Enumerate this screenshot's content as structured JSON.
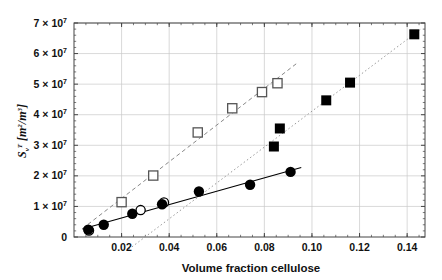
{
  "figure": {
    "title": "",
    "background": "#ffffff",
    "frame_color": "#444444",
    "grid_color": "#c9c9c9"
  },
  "axes": {
    "x": {
      "label": "Volume fraction cellulose",
      "ticks": [
        0.02,
        0.04,
        0.06,
        0.08,
        0.1,
        0.12,
        0.14
      ],
      "tick_labels": [
        "0.02",
        "0.04",
        "0.06",
        "0.08",
        "0.10",
        "0.12",
        "0.14"
      ],
      "range": [
        0.0,
        0.1475
      ]
    },
    "y": {
      "label_main": "S",
      "label_sub": "v",
      "label_sup": "T",
      "label_units": "[m2/m3]",
      "label_plain": "Sv T [m^2/m^3]",
      "ticks": [
        0,
        10000000,
        20000000,
        30000000,
        40000000,
        50000000,
        60000000,
        70000000
      ],
      "tick_labels": [
        "0",
        "1 × 10",
        "2 × 10",
        "3 × 10",
        "4 × 10",
        "5 × 10",
        "6 × 10",
        "7 × 10"
      ],
      "tick_exponent": "7",
      "range": [
        0,
        70000000
      ]
    }
  },
  "chart_data": {
    "type": "scatter",
    "title": "",
    "xlabel": "Volume fraction cellulose",
    "ylabel": "Sv T [m^2/m^3]",
    "xlim": [
      0.0,
      0.1475
    ],
    "ylim": [
      0,
      70000000
    ],
    "grid": true,
    "legend": "none",
    "series": [
      {
        "name": "filled-circles",
        "marker": "filled-circle",
        "color": "#000000",
        "fit_line": {
          "style": "solid",
          "color": "#000000",
          "x_start": 0.0035,
          "x_end": 0.0955
        },
        "points": [
          {
            "x": 0.006,
            "y": 2400000
          },
          {
            "x": 0.0125,
            "y": 4000000
          },
          {
            "x": 0.0245,
            "y": 7600000
          },
          {
            "x": 0.037,
            "y": 10700000
          },
          {
            "x": 0.0525,
            "y": 14900000
          },
          {
            "x": 0.074,
            "y": 17100000
          },
          {
            "x": 0.091,
            "y": 21300000
          }
        ]
      },
      {
        "name": "open-circles",
        "marker": "open-circle",
        "color": "#000000",
        "fit_line": null,
        "points": [
          {
            "x": 0.0063,
            "y": 2100000
          },
          {
            "x": 0.028,
            "y": 8800000
          },
          {
            "x": 0.0378,
            "y": 11300000
          }
        ]
      },
      {
        "name": "open-squares",
        "marker": "open-square",
        "color": "#555555",
        "fit_line": {
          "style": "dashed",
          "color": "#888888",
          "x_start": 0.0035,
          "x_end": 0.0935
        },
        "points": [
          {
            "x": 0.02,
            "y": 11400000
          },
          {
            "x": 0.0333,
            "y": 20100000
          },
          {
            "x": 0.052,
            "y": 34200000
          },
          {
            "x": 0.0665,
            "y": 42100000
          },
          {
            "x": 0.079,
            "y": 47400000
          },
          {
            "x": 0.0855,
            "y": 50300000
          }
        ]
      },
      {
        "name": "filled-squares",
        "marker": "filled-square",
        "color": "#000000",
        "fit_line": {
          "style": "dotted",
          "color": "#9a9a9a",
          "x_start": 0.023,
          "x_end": 0.1455
        },
        "points": [
          {
            "x": 0.084,
            "y": 29600000
          },
          {
            "x": 0.0865,
            "y": 35500000
          },
          {
            "x": 0.106,
            "y": 44700000
          },
          {
            "x": 0.116,
            "y": 50500000
          },
          {
            "x": 0.143,
            "y": 66300000
          }
        ]
      }
    ]
  }
}
